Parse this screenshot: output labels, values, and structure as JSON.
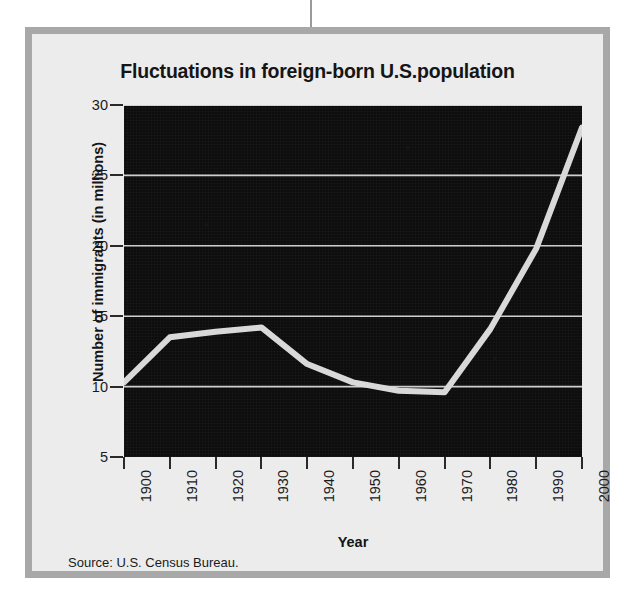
{
  "figure": {
    "title": "Fluctuations in foreign-born U.S.population",
    "source_note": "Source: U.S. Census Bureau."
  },
  "colors": {
    "plot_background": "#0d0d0d",
    "line": "#d9d9d9",
    "gridline": "#cfcfcf",
    "frame_border": "#a8a8a8",
    "panel_background": "#ececed",
    "text": "#151515"
  },
  "chart_data": {
    "type": "line",
    "title": "Fluctuations in foreign-born U.S.population",
    "xlabel": "Year",
    "ylabel": "Number of immigrants (in millions)",
    "x": [
      1900,
      1910,
      1920,
      1930,
      1940,
      1950,
      1960,
      1970,
      1980,
      1990,
      2000
    ],
    "categories": [
      "1900",
      "1910",
      "1920",
      "1930",
      "1940",
      "1950",
      "1960",
      "1970",
      "1980",
      "1990",
      "2000"
    ],
    "values": [
      10.3,
      13.5,
      13.9,
      14.2,
      11.6,
      10.3,
      9.7,
      9.6,
      14.1,
      19.8,
      28.4
    ],
    "series": [
      {
        "name": "Foreign-born population",
        "values": [
          10.3,
          13.5,
          13.9,
          14.2,
          11.6,
          10.3,
          9.7,
          9.6,
          14.1,
          19.8,
          28.4
        ]
      }
    ],
    "xlim": [
      1900,
      2000
    ],
    "ylim": [
      5,
      30
    ],
    "yticks": [
      5,
      10,
      15,
      20,
      25,
      30
    ],
    "ytick_labels": [
      "5",
      "10",
      "15",
      "20",
      "25",
      "30"
    ],
    "xticks": [
      1900,
      1910,
      1920,
      1930,
      1940,
      1950,
      1960,
      1970,
      1980,
      1990,
      2000
    ],
    "xtick_labels": [
      "1900",
      "1910",
      "1920",
      "1930",
      "1940",
      "1950",
      "1960",
      "1970",
      "1980",
      "1990",
      "2000"
    ],
    "xtick_rotation": 90,
    "grid": "horizontal",
    "legend": "none",
    "line_width": 6,
    "annotations": [
      "Source: U.S. Census Bureau."
    ]
  }
}
